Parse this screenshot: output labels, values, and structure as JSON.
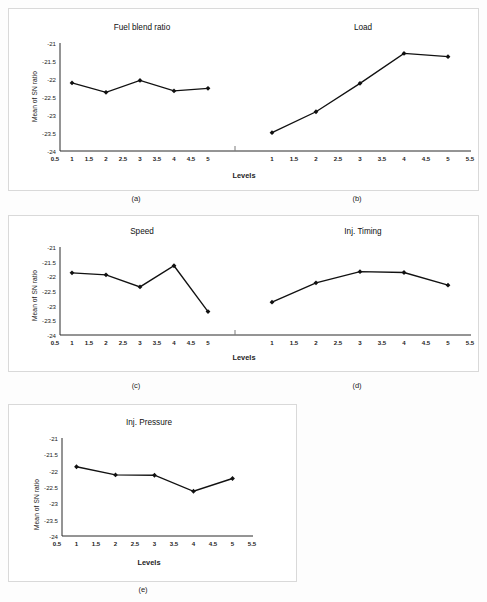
{
  "figure": {
    "y_axis_label": "Mean of SN ratio",
    "x_axis_label": "Levels",
    "y_ticks": [
      "-21",
      "-21.5",
      "-22",
      "-22.5",
      "-23",
      "-23.5",
      "-24"
    ],
    "x_ticks_left": [
      "0.5",
      "1",
      "1.5",
      "2",
      "2.5",
      "3",
      "3.5",
      "4",
      "4.5",
      "5"
    ],
    "x_ticks_right": [
      "1",
      "1.5",
      "2",
      "2.5",
      "3",
      "3.5",
      "4",
      "4.5",
      "5",
      "5.5"
    ],
    "x_ticks_single": [
      "0.5",
      "1",
      "1.5",
      "2",
      "2.5",
      "3",
      "3.5",
      "4",
      "4.5",
      "5",
      "5.5"
    ],
    "line_color": "#111111",
    "axis_color": "#2b2b2b",
    "panel_border_color": "#d9d9d9",
    "captions": {
      "a": "(a)",
      "b": "(b)",
      "c": "(c)",
      "d": "(d)",
      "e": "(e)"
    }
  },
  "chart_data": [
    {
      "type": "line",
      "title": "Fuel blend ratio",
      "panel": "(a)",
      "xlabel": "Levels",
      "ylabel": "Mean of SN ratio",
      "x": [
        1,
        2,
        3,
        4,
        5
      ],
      "values": [
        -22.11,
        -22.37,
        -22.04,
        -22.33,
        -22.26
      ],
      "xlim": [
        0.5,
        5.5
      ],
      "ylim": [
        -24,
        -21
      ],
      "grid": false,
      "legend": "none",
      "marker": "diamond"
    },
    {
      "type": "line",
      "title": "Load",
      "panel": "(b)",
      "xlabel": "Levels",
      "ylabel": "Mean of SN ratio",
      "x": [
        1,
        2,
        3,
        4,
        5
      ],
      "values": [
        -23.49,
        -22.91,
        -22.12,
        -21.29,
        -21.38
      ],
      "xlim": [
        0.5,
        5.5
      ],
      "ylim": [
        -24,
        -21
      ],
      "grid": false,
      "legend": "none",
      "marker": "diamond"
    },
    {
      "type": "line",
      "title": "Speed",
      "panel": "(c)",
      "xlabel": "Levels",
      "ylabel": "Mean of SN ratio",
      "x": [
        1,
        2,
        3,
        4,
        5
      ],
      "values": [
        -21.88,
        -21.95,
        -22.36,
        -21.64,
        -23.2
      ],
      "xlim": [
        0.5,
        5.5
      ],
      "ylim": [
        -24,
        -21
      ],
      "grid": false,
      "legend": "none",
      "marker": "diamond"
    },
    {
      "type": "line",
      "title": "Inj. Timing",
      "panel": "(d)",
      "xlabel": "Levels",
      "ylabel": "Mean of SN ratio",
      "x": [
        1,
        2,
        3,
        4,
        5
      ],
      "values": [
        -22.88,
        -22.22,
        -21.84,
        -21.87,
        -22.3
      ],
      "xlim": [
        0.5,
        5.5
      ],
      "ylim": [
        -24,
        -21
      ],
      "grid": false,
      "legend": "none",
      "marker": "diamond"
    },
    {
      "type": "line",
      "title": "Inj. Pressure",
      "panel": "(e)",
      "xlabel": "Levels",
      "ylabel": "Mean of SN ratio",
      "x": [
        1,
        2,
        3,
        4,
        5
      ],
      "values": [
        -21.88,
        -22.13,
        -22.14,
        -22.63,
        -22.24
      ],
      "xlim": [
        0.5,
        5.5
      ],
      "ylim": [
        -24,
        -21
      ],
      "grid": false,
      "legend": "none",
      "marker": "diamond"
    }
  ]
}
